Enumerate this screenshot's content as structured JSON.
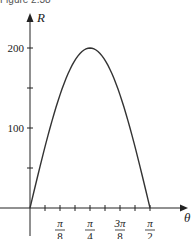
{
  "caption": "Figure 2.38",
  "chart_data": {
    "type": "line",
    "title": "",
    "xlabel": "θ",
    "ylabel": "R",
    "series": [
      {
        "name": "R = 200 sin(2θ)",
        "x": [
          0,
          0.1963,
          0.3927,
          0.589,
          0.7854,
          0.9817,
          1.1781,
          1.3744,
          1.5708
        ],
        "x_labels": [
          "0",
          "π/16",
          "π/8",
          "3π/16",
          "π/4",
          "5π/16",
          "3π/8",
          "7π/16",
          "π/2"
        ],
        "values": [
          0,
          76.5,
          141.4,
          184.8,
          200,
          184.8,
          141.4,
          76.5,
          0
        ]
      }
    ],
    "xticks": [
      {
        "value": 0.3927,
        "label_num": "π",
        "label_den": "8"
      },
      {
        "value": 0.7854,
        "label_num": "π",
        "label_den": "4"
      },
      {
        "value": 1.1781,
        "label_num": "3π",
        "label_den": "8"
      },
      {
        "value": 1.5708,
        "label_num": "π",
        "label_den": "2"
      }
    ],
    "yticks": [
      {
        "value": 50,
        "label": ""
      },
      {
        "value": 100,
        "label": "100"
      },
      {
        "value": 150,
        "label": ""
      },
      {
        "value": 200,
        "label": "200"
      }
    ],
    "xlim": [
      0,
      1.8
    ],
    "ylim": [
      0,
      220
    ],
    "grid": false,
    "legend": "none"
  }
}
